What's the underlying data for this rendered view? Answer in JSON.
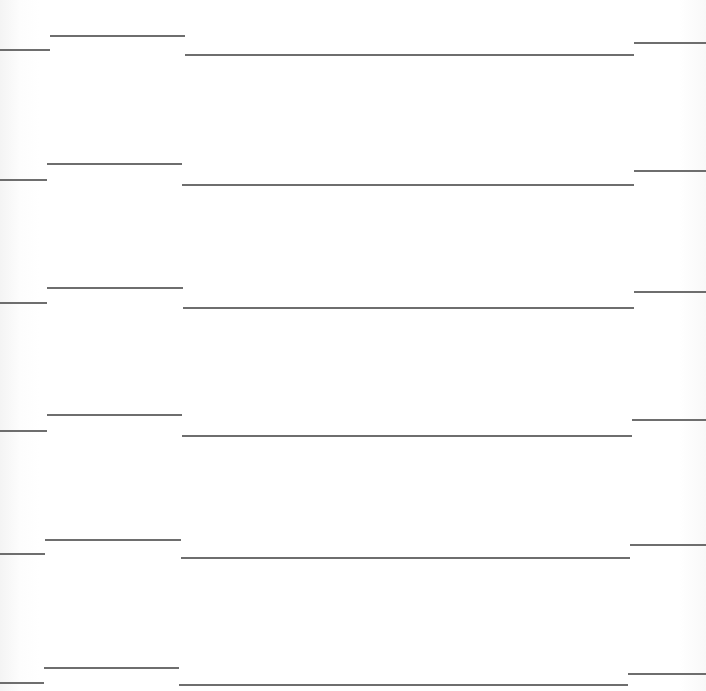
{
  "document": {
    "type": "lined-form-page",
    "line_color": "#555555",
    "background_color": "#ffffff",
    "rows": [
      {
        "segments": [
          {
            "x1": 0,
            "x2": 50,
            "y": 49
          },
          {
            "x1": 50,
            "x2": 185,
            "y": 35
          },
          {
            "x1": 185,
            "x2": 634,
            "y": 54
          },
          {
            "x1": 634,
            "x2": 706,
            "y": 42
          }
        ]
      },
      {
        "segments": [
          {
            "x1": 0,
            "x2": 47,
            "y": 179
          },
          {
            "x1": 47,
            "x2": 182,
            "y": 163
          },
          {
            "x1": 182,
            "x2": 634,
            "y": 184
          },
          {
            "x1": 634,
            "x2": 706,
            "y": 170
          }
        ]
      },
      {
        "segments": [
          {
            "x1": 0,
            "x2": 47,
            "y": 302
          },
          {
            "x1": 47,
            "x2": 183,
            "y": 287
          },
          {
            "x1": 183,
            "x2": 634,
            "y": 307
          },
          {
            "x1": 634,
            "x2": 706,
            "y": 291
          }
        ]
      },
      {
        "segments": [
          {
            "x1": 0,
            "x2": 47,
            "y": 430
          },
          {
            "x1": 47,
            "x2": 182,
            "y": 414
          },
          {
            "x1": 182,
            "x2": 632,
            "y": 435
          },
          {
            "x1": 632,
            "x2": 706,
            "y": 419
          }
        ]
      },
      {
        "segments": [
          {
            "x1": 0,
            "x2": 45,
            "y": 553
          },
          {
            "x1": 45,
            "x2": 181,
            "y": 539
          },
          {
            "x1": 181,
            "x2": 630,
            "y": 557
          },
          {
            "x1": 630,
            "x2": 706,
            "y": 544
          }
        ]
      },
      {
        "segments": [
          {
            "x1": 0,
            "x2": 44,
            "y": 682
          },
          {
            "x1": 44,
            "x2": 179,
            "y": 667
          },
          {
            "x1": 179,
            "x2": 628,
            "y": 684
          },
          {
            "x1": 628,
            "x2": 706,
            "y": 673
          }
        ]
      }
    ]
  }
}
